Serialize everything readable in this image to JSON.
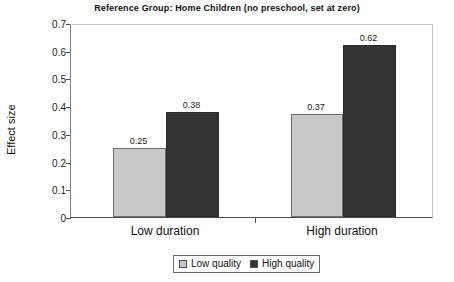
{
  "chart_data": {
    "type": "bar",
    "title": "Reference Group: Home Children (no preschool, set at zero)",
    "xlabel": "",
    "ylabel": "Effect size",
    "ylim": [
      0,
      0.7
    ],
    "ytick_labels": [
      "0.7",
      "0.6",
      "0.5",
      "0.4",
      "0.3",
      "0.2",
      "0.1",
      "0"
    ],
    "ytick_values": [
      0.7,
      0.6,
      0.5,
      0.4,
      0.3,
      0.2,
      0.1,
      0
    ],
    "grid": false,
    "legend_position": "bottom-center",
    "categories": [
      "Low duration",
      "High duration"
    ],
    "series": [
      {
        "name": "Low quality",
        "color": "#c8c8c8",
        "values": [
          0.25,
          0.37
        ],
        "labels": [
          "0.25",
          "0.37"
        ]
      },
      {
        "name": "High quality",
        "color": "#333333",
        "values": [
          0.38,
          0.62
        ],
        "labels": [
          "0.38",
          "0.62"
        ]
      }
    ]
  },
  "colors": {
    "low_quality": "#c8c8c8",
    "high_quality": "#333333",
    "axis": "#4d4d4d",
    "text": "#111111",
    "background": "#ffffff"
  }
}
